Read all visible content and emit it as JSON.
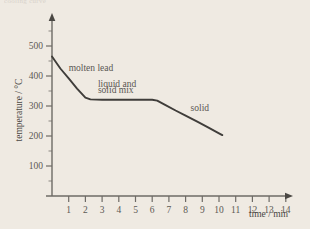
{
  "figure": {
    "background_color": "#efeae2",
    "curve_color": "#3f3d3a",
    "text_color": "#5c5954",
    "axis_color": "#6e6b66",
    "cropped_caption": "cooling curve"
  },
  "chart_data": {
    "type": "line",
    "title": "",
    "xlabel": "time / min",
    "ylabel": "temperature / °C",
    "xlim": [
      0,
      14.6
    ],
    "ylim": [
      0,
      540
    ],
    "grid": false,
    "legend": null,
    "xticks": [
      1,
      2,
      3,
      4,
      5,
      6,
      7,
      8,
      9,
      10,
      11,
      12,
      13,
      14
    ],
    "xtick_labels": [
      "1",
      "2",
      "3",
      "4",
      "5",
      "6",
      "7",
      "8",
      "9",
      "10",
      "11",
      "12",
      "13",
      "14"
    ],
    "yticks": [
      100,
      200,
      300,
      400,
      500
    ],
    "ytick_labels": [
      "100",
      "200",
      "300",
      "400",
      "500"
    ],
    "yminor_ticks": [
      50,
      150,
      250,
      350,
      450,
      550
    ],
    "series": [
      {
        "name": "cooling curve of lead",
        "x": [
          0.0,
          0.5,
          1.0,
          1.5,
          2.0,
          2.3,
          3.0,
          4.0,
          5.0,
          6.0,
          6.3,
          6.8,
          7.4,
          8.0,
          8.7,
          9.4,
          10.0,
          10.2
        ],
        "y": [
          465,
          425,
          392,
          358,
          328,
          322,
          321,
          321,
          321,
          321,
          318,
          303,
          285,
          268,
          248,
          227,
          209,
          203
        ]
      }
    ],
    "annotations": [
      {
        "text": "molten lead",
        "x": 1.0,
        "y": 418
      },
      {
        "text": "liquid and",
        "x": 2.75,
        "y": 363
      },
      {
        "text": "solid mix",
        "x": 2.75,
        "y": 343
      },
      {
        "text": "solid",
        "x": 8.3,
        "y": 283
      }
    ]
  }
}
